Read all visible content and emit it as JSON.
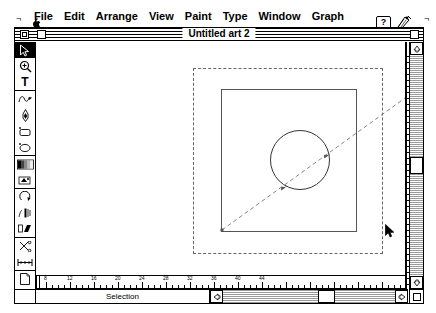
{
  "menubar": {
    "apple_icon": "apple-logo",
    "items": [
      {
        "label": "File"
      },
      {
        "label": "Edit"
      },
      {
        "label": "Arrange"
      },
      {
        "label": "View"
      },
      {
        "label": "Paint"
      },
      {
        "label": "Type"
      },
      {
        "label": "Window"
      },
      {
        "label": "Graph"
      }
    ],
    "help_label": "?",
    "help_icon": "help-balloon-icon",
    "app_icon": "application-icon"
  },
  "window": {
    "title": "Untitled art 2",
    "close_box": "close-box",
    "zoom_box": "zoom-box",
    "grow_box": "grow-box"
  },
  "toolbox": {
    "tools": [
      {
        "name": "selection-tool",
        "icon": "arrow-pointer-icon",
        "selected": true
      },
      {
        "name": "zoom-tool",
        "icon": "magnifier-icon",
        "selected": false
      },
      {
        "name": "type-tool",
        "icon": "type-t-icon",
        "label": "T",
        "selected": false
      },
      {
        "name": "freehand-tool",
        "icon": "freehand-pen-icon",
        "selected": false
      },
      {
        "name": "pen-tool",
        "icon": "fountain-pen-icon",
        "selected": false
      },
      {
        "name": "rectangle-tool",
        "icon": "rectangle-icon",
        "selected": false
      },
      {
        "name": "oval-tool",
        "icon": "oval-icon",
        "selected": false
      },
      {
        "name": "blend-tool",
        "icon": "gradient-blend-icon",
        "selected": false
      },
      {
        "name": "paint-tool",
        "icon": "paint-bucket-icon",
        "selected": false
      },
      {
        "name": "rotate-tool",
        "icon": "rotate-icon",
        "selected": false
      },
      {
        "name": "scale-tool",
        "icon": "scale-icon",
        "selected": false
      },
      {
        "name": "shear-tool",
        "icon": "shear-icon",
        "selected": false
      },
      {
        "name": "scissors-tool",
        "icon": "scissors-icon",
        "selected": false
      },
      {
        "name": "measure-tool",
        "icon": "measure-ruler-icon",
        "selected": false
      },
      {
        "name": "page-tool",
        "icon": "page-icon",
        "selected": false
      },
      {
        "name": "graph-tool",
        "icon": "bar-chart-icon",
        "selected": false
      }
    ]
  },
  "canvas": {
    "page_boundary": "dashed-page-boundary",
    "shapes": [
      {
        "name": "square-path",
        "type": "rectangle"
      },
      {
        "name": "circle-path",
        "type": "ellipse"
      },
      {
        "name": "diagonal-path",
        "type": "dashed-line"
      }
    ],
    "cursor": "mouse-pointer-arrow"
  },
  "rulers": {
    "horizontal_unit_labels": [
      "8",
      "12",
      "16",
      "20",
      "24",
      "28",
      "32",
      "36",
      "40",
      "44"
    ],
    "vertical_unit_labels": [
      "40",
      "36",
      "32",
      "28",
      "24"
    ]
  },
  "statusbar": {
    "status_text": "Selection"
  },
  "scrollbars": {
    "up_arrow": "scroll-up-arrow",
    "down_arrow": "scroll-down-arrow",
    "left_arrow": "scroll-left-arrow",
    "right_arrow": "scroll-right-arrow",
    "v_thumb": "vertical-scroll-thumb",
    "h_thumb": "horizontal-scroll-thumb"
  },
  "colors": {
    "window_bg": "#ffffff",
    "outline": "#000000",
    "scrollbar_track": "#e8e8e8",
    "art_stroke": "#555555",
    "dash_guide": "#666666"
  }
}
